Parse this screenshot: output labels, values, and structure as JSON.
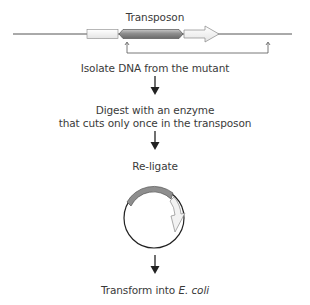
{
  "diagram": {
    "type": "flowchart",
    "top_construct": {
      "label": "Transposon",
      "elements": [
        "flanking-dna-left",
        "left-box",
        "transposon",
        "arrow-gene",
        "flanking-dna-right"
      ]
    },
    "steps": [
      {
        "label": "Isolate DNA from the mutant"
      },
      {
        "label_line1": "Digest with an enzyme",
        "label_line2": "that cuts only once in the transposon"
      },
      {
        "label": "Re-ligate"
      },
      {
        "label_prefix": "Transform into ",
        "label_italic": "E. coli"
      }
    ],
    "colors": {
      "line": "#555555",
      "transposon_fill": "#8a8a8a",
      "box_fill": "#f4f4f4",
      "text": "#3a3a3a"
    }
  }
}
